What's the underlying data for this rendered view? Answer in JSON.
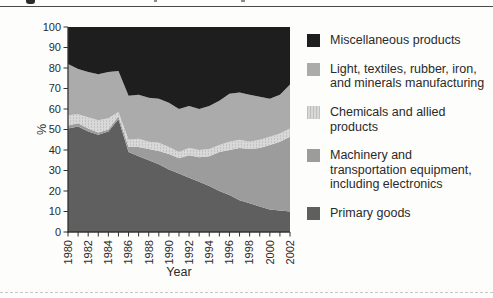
{
  "chart_data": {
    "type": "area",
    "stacked": true,
    "xlabel": "Year",
    "ylabel": "%",
    "ylim": [
      0,
      100
    ],
    "y_ticks": [
      0,
      10,
      20,
      30,
      40,
      50,
      60,
      70,
      80,
      90,
      100
    ],
    "x_tick_label_every": 2,
    "x": [
      1980,
      1981,
      1982,
      1983,
      1984,
      1985,
      1986,
      1987,
      1988,
      1989,
      1990,
      1991,
      1992,
      1993,
      1994,
      1995,
      1996,
      1997,
      1998,
      1999,
      2000,
      2001,
      2002
    ],
    "series": [
      {
        "name": "Primary goods",
        "color": "#5f5f5f",
        "values": [
          50.5,
          51.5,
          49,
          47.5,
          49,
          55,
          39,
          37,
          35,
          33,
          30.5,
          28.5,
          26.5,
          24.5,
          22.5,
          20,
          18,
          15.5,
          14,
          12.5,
          11,
          10.5,
          10
        ]
      },
      {
        "name": "Machinery and transportation equipment, including electronics",
        "color": "#9c9c9c",
        "values": [
          1.5,
          1.5,
          1.5,
          1,
          1,
          1.5,
          2.5,
          4.5,
          5.5,
          6.5,
          7.5,
          7.5,
          11,
          12,
          14.5,
          19,
          22,
          25.5,
          26.5,
          28.5,
          31.5,
          33.5,
          36.5
        ]
      },
      {
        "name": "Chemicals and allied products",
        "color": "#d8d8d8",
        "textured": true,
        "values": [
          5,
          4.5,
          5.5,
          6,
          5.5,
          2,
          3.5,
          4,
          3.5,
          4,
          3.5,
          3,
          3.5,
          3.5,
          3.5,
          3.5,
          4,
          4,
          3.5,
          4,
          4,
          4,
          4
        ]
      },
      {
        "name": "Light, textiles, rubber, iron, and minerals manufacturing",
        "color": "#ababab",
        "values": [
          25,
          22,
          22,
          22.5,
          22.5,
          20,
          21.5,
          21.5,
          21.5,
          21.5,
          21.5,
          21,
          20.5,
          20,
          21,
          21.5,
          23.5,
          23,
          23,
          21,
          18.5,
          19,
          21.5
        ]
      },
      {
        "name": "Miscellaneous products",
        "color": "#1e1e1e",
        "values": [
          18,
          20.5,
          22,
          23,
          22,
          21.5,
          33.5,
          33,
          34.5,
          35,
          37,
          40,
          38.5,
          40,
          38.5,
          36,
          32.5,
          32,
          33,
          34,
          35,
          33,
          28
        ]
      }
    ],
    "legend_position": "right",
    "grid": false
  },
  "legend": {
    "items": [
      {
        "key": "miscellaneous-products",
        "lines": [
          "Miscellaneous products"
        ],
        "color": "#1e1e1e",
        "textured": false
      },
      {
        "key": "light-textiles-rubber-iron",
        "lines": [
          "Light, textiles, rubber, iron,",
          "and minerals manufacturing"
        ],
        "color": "#ababab",
        "textured": false
      },
      {
        "key": "chemicals-allied-products",
        "lines": [
          "Chemicals and allied",
          "products"
        ],
        "color": "#d8d8d8",
        "textured": true
      },
      {
        "key": "machinery-transportation",
        "lines": [
          "Machinery and",
          "transportation equipment,",
          "including electronics"
        ],
        "color": "#9c9c9c",
        "textured": false
      },
      {
        "key": "primary-goods",
        "lines": [
          "Primary goods"
        ],
        "color": "#5f5f5f",
        "textured": false
      }
    ]
  },
  "colors": {
    "axis": "#333333",
    "tick_text": "#2a2a2a",
    "top_rule": "#4a4a4a",
    "chem_fleck": "#c3c3c3"
  }
}
